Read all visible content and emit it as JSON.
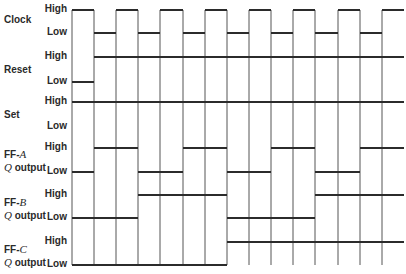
{
  "diagram": {
    "type": "timing-diagram",
    "level_labels": {
      "high": "High",
      "low": "Low"
    },
    "signals": [
      {
        "id": "clock",
        "name": "Clock",
        "name_prefix": "",
        "name_italic": "",
        "name_suffix": "",
        "high_y": 10,
        "low_y": 33,
        "states": [
          1,
          0,
          1,
          0,
          1,
          0,
          1,
          0,
          1,
          0,
          1,
          0,
          1,
          0,
          1
        ]
      },
      {
        "id": "reset",
        "name": "Reset",
        "name_prefix": "",
        "name_italic": "",
        "name_suffix": "",
        "high_y": 57,
        "low_y": 82,
        "states": [
          0,
          1,
          1,
          1,
          1,
          1,
          1,
          1,
          1,
          1,
          1,
          1,
          1,
          1,
          1
        ]
      },
      {
        "id": "set",
        "name": "Set",
        "name_prefix": "",
        "name_italic": "",
        "name_suffix": "",
        "high_y": 102,
        "low_y": 127,
        "states": [
          1,
          1,
          1,
          1,
          1,
          1,
          1,
          1,
          1,
          1,
          1,
          1,
          1,
          1,
          1
        ]
      },
      {
        "id": "ff-a",
        "name_prefix": "FF-",
        "name_italic": "A",
        "name_q": "Q",
        "name_suffix": " output",
        "high_y": 148,
        "low_y": 172,
        "states": [
          0,
          1,
          1,
          0,
          0,
          1,
          1,
          0,
          0,
          1,
          1,
          0,
          0,
          1,
          1
        ]
      },
      {
        "id": "ff-b",
        "name_prefix": "FF-",
        "name_italic": "B",
        "name_q": "Q",
        "name_suffix": " output",
        "high_y": 195,
        "low_y": 218,
        "states": [
          0,
          0,
          0,
          1,
          1,
          1,
          1,
          0,
          0,
          0,
          0,
          1,
          1,
          1,
          1
        ]
      },
      {
        "id": "ff-c",
        "name_prefix": "FF-",
        "name_italic": "C",
        "name_q": "Q",
        "name_suffix": " output",
        "high_y": 242,
        "low_y": 265,
        "states": [
          0,
          0,
          0,
          0,
          0,
          0,
          0,
          1,
          1,
          1,
          1,
          1,
          1,
          1,
          1
        ]
      }
    ],
    "time_boundaries_x": [
      72,
      94,
      116,
      138,
      160,
      183,
      205,
      227,
      249,
      271,
      293,
      315,
      338,
      360,
      382,
      404
    ],
    "colors": {
      "trace": "#2b2b2b",
      "gridline": "#555555",
      "text": "#2a2a2a",
      "background": "#ffffff"
    }
  }
}
